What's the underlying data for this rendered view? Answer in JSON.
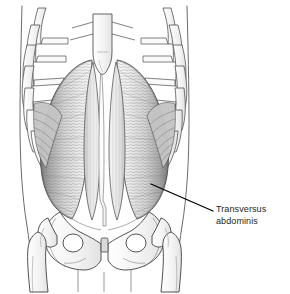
{
  "figure": {
    "background_color": "#ffffff",
    "width": 290,
    "height": 294,
    "style": "grayscale line drawing with hatched muscle shading"
  },
  "callout": {
    "label_line_1": "Transversus",
    "label_line_2": "abdominis",
    "text_color": "#231f20",
    "leader_line": {
      "from_x": 151,
      "from_y": 184,
      "to_x": 213,
      "to_y": 211,
      "color": "#000000"
    }
  },
  "palette": {
    "outline": "#3f3f3f",
    "bone_fill": "#f4f4f4",
    "bone_stroke": "#4a4a4a",
    "muscle_light": "#e8e8e8",
    "muscle_mid": "#bdbdbd",
    "muscle_dark": "#8a8a8a",
    "muscle_shadow": "#6f6f6f",
    "linea_alba": "#fdfdfd",
    "fiber_stroke": "#7b7b7b",
    "body_contour": "#5a5a5a"
  },
  "structures": [
    {
      "id": "body-contour",
      "label": "Torso body outline",
      "side": "both"
    },
    {
      "id": "sternum",
      "label": "Sternum with xiphoid process",
      "side": "center"
    },
    {
      "id": "ribcage-left",
      "label": "Left ribs and costal cartilages",
      "side": "left",
      "rib_count": 8
    },
    {
      "id": "ribcage-right",
      "label": "Right ribs and costal cartilages",
      "side": "right",
      "rib_count": 8
    },
    {
      "id": "transversus-abdominis-left",
      "label": "Transversus abdominis muscle, left",
      "side": "left"
    },
    {
      "id": "transversus-abdominis-right",
      "label": "Transversus abdominis muscle, right",
      "side": "right"
    },
    {
      "id": "linea-alba",
      "label": "Linea alba",
      "side": "center"
    },
    {
      "id": "rectus-sheath-left",
      "label": "Rectus sheath, left",
      "side": "left"
    },
    {
      "id": "rectus-sheath-right",
      "label": "Rectus sheath, right",
      "side": "right"
    },
    {
      "id": "internal-oblique-left",
      "label": "Deep oblique fibers beneath ribs, left",
      "side": "left"
    },
    {
      "id": "internal-oblique-right",
      "label": "Deep oblique fibers beneath ribs, right",
      "side": "right"
    },
    {
      "id": "pelvis",
      "label": "Pelvis with ilium and obturator foramina",
      "side": "center"
    },
    {
      "id": "pubic-symphysis",
      "label": "Pubic symphysis",
      "side": "center"
    },
    {
      "id": "femur-left",
      "label": "Left femur head, neck and shaft",
      "side": "left"
    },
    {
      "id": "femur-right",
      "label": "Right femur head, neck and shaft",
      "side": "right"
    }
  ]
}
